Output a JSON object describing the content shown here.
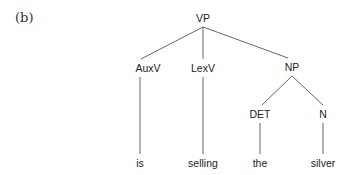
{
  "figure_label": "(b)",
  "tree": {
    "root": "VP",
    "nodes": {
      "vp": "VP",
      "auxv": "AuxV",
      "lexv": "LexV",
      "np": "NP",
      "det": "DET",
      "n": "N"
    },
    "leaves": {
      "is": "is",
      "selling": "selling",
      "the": "the",
      "silver": "silver"
    },
    "edges": [
      [
        "VP",
        "AuxV"
      ],
      [
        "VP",
        "LexV"
      ],
      [
        "VP",
        "NP"
      ],
      [
        "AuxV",
        "is"
      ],
      [
        "LexV",
        "selling"
      ],
      [
        "NP",
        "DET"
      ],
      [
        "NP",
        "N"
      ],
      [
        "DET",
        "the"
      ],
      [
        "N",
        "silver"
      ]
    ]
  }
}
